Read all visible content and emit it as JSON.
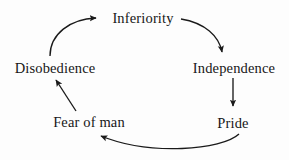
{
  "diagram": {
    "type": "cycle",
    "background_color": "#fdfdfd",
    "stroke_color": "#1a1a1a",
    "text_color": "#171717",
    "nodes": [
      {
        "id": "inferiority",
        "label": "Inferiority",
        "position": "top"
      },
      {
        "id": "independence",
        "label": "Independence",
        "position": "right"
      },
      {
        "id": "pride",
        "label": "Pride",
        "position": "bottom-right"
      },
      {
        "id": "fear_of_man",
        "label": "Fear of man",
        "position": "bottom-left"
      },
      {
        "id": "disobedience",
        "label": "Disobedience",
        "position": "left"
      }
    ],
    "edges": [
      {
        "from": "inferiority",
        "to": "independence",
        "style": "curved",
        "direction": "clockwise"
      },
      {
        "from": "independence",
        "to": "pride",
        "style": "straight",
        "direction": "down"
      },
      {
        "from": "pride",
        "to": "fear_of_man",
        "style": "curved",
        "direction": "clockwise"
      },
      {
        "from": "fear_of_man",
        "to": "disobedience",
        "style": "straight",
        "direction": "up-left"
      },
      {
        "from": "disobedience",
        "to": "inferiority",
        "style": "curved",
        "direction": "clockwise"
      }
    ]
  }
}
